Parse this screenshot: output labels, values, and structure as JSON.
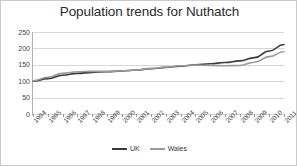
{
  "chart_data": {
    "type": "line",
    "title": "Population trends for Nuthatch",
    "xlabel": "",
    "ylabel": "",
    "ylim": [
      0,
      250
    ],
    "yticks": [
      0,
      50,
      100,
      150,
      200,
      250
    ],
    "grid": true,
    "legend_position": "bottom",
    "categories": [
      "1994",
      "1995",
      "1996",
      "1997",
      "1998",
      "1999",
      "2000",
      "2001",
      "2002",
      "2003",
      "2004",
      "2005",
      "2006",
      "2007",
      "2008",
      "2009",
      "2010",
      "2011"
    ],
    "series": [
      {
        "name": "UK",
        "color": "#3a3a3a",
        "values": [
          100,
          108,
          118,
          124,
          127,
          129,
          131,
          134,
          138,
          142,
          146,
          150,
          153,
          157,
          162,
          172,
          192,
          212
        ]
      },
      {
        "name": "Wales",
        "color": "#9a9a9a",
        "values": [
          101,
          112,
          124,
          129,
          130,
          130,
          131,
          134,
          139,
          143,
          147,
          149,
          148,
          147,
          148,
          158,
          175,
          190
        ]
      }
    ]
  },
  "legend": {
    "items": [
      {
        "label": "UK",
        "color": "#3a3a3a"
      },
      {
        "label": "Wales",
        "color": "#9a9a9a"
      }
    ]
  },
  "colors": {
    "uk_line": "#3a3a3a",
    "wales_line": "#9a9a9a",
    "gridline": "#d6d6d6",
    "axis": "#9a9a9a",
    "background": "#ffffff",
    "border": "#c9c9c9",
    "title_text": "#2b2b2b",
    "tick_text": "#3d3d3d"
  }
}
